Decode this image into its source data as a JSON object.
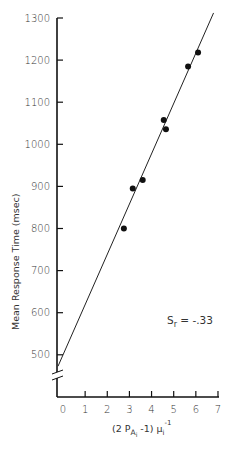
{
  "chart_data": {
    "type": "scatter",
    "title": "",
    "xlabel": "(2 P_Ai - 1) μ_i^-1",
    "ylabel": "Mean Response Time (msec)",
    "xlim": [
      0,
      7
    ],
    "ylim": [
      450,
      1300
    ],
    "y_axis_break": true,
    "grid": false,
    "legend": null,
    "x_ticks": [
      0,
      1,
      2,
      3,
      4,
      5,
      6,
      7
    ],
    "y_ticks": [
      500,
      600,
      700,
      800,
      900,
      1000,
      1100,
      1200,
      1300
    ],
    "series": [
      {
        "name": "observed",
        "type": "scatter",
        "x": [
          2.75,
          3.15,
          3.6,
          4.55,
          4.65,
          5.65,
          6.1
        ],
        "y": [
          800,
          895,
          915,
          1058,
          1036,
          1185,
          1218
        ]
      },
      {
        "name": "fitted line",
        "type": "line",
        "x": [
          0,
          6.8
        ],
        "y": [
          480,
          1312
        ]
      }
    ],
    "annotations": [
      {
        "text": "S_r = -.33",
        "x": 5.0,
        "y": 545
      }
    ]
  },
  "labels": {
    "ylabel": "Mean Response Time (msec)",
    "xlabel_main": "(2 P",
    "xlabel_sub": "A",
    "xlabel_subsub": "i",
    "xlabel_tail": " -1) μ",
    "xlabel_mu_sub": "i",
    "xlabel_sup": "-1",
    "annot_s": "S",
    "annot_sub": "r",
    "annot_rest": " =   -.33"
  }
}
